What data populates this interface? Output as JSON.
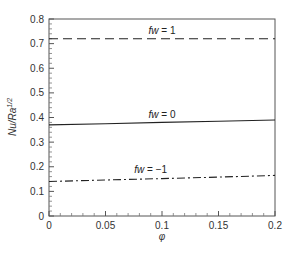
{
  "chart_data": {
    "type": "line",
    "title": "",
    "xlabel": "φ",
    "ylabel": "Nu/Ra^1/2",
    "ylabel_main": "Nu/Ra",
    "ylabel_sup": "1/2",
    "xlim": [
      0,
      0.2
    ],
    "ylim": [
      0,
      0.8
    ],
    "grid": false,
    "legend_position": "inline labels",
    "x_ticks": [
      0,
      0.05,
      0.1,
      0.15,
      0.2
    ],
    "x_tick_labels": [
      "0",
      "0.05",
      "0.1",
      "0.15",
      "0.2"
    ],
    "y_ticks": [
      0,
      0.1,
      0.2,
      0.3,
      0.4,
      0.5,
      0.6,
      0.7,
      0.8
    ],
    "y_tick_labels": [
      "0",
      "0.1",
      "0.2",
      "0.3",
      "0.4",
      "0.5",
      "0.6",
      "0.7",
      "0.8"
    ],
    "x": [
      0,
      0.05,
      0.1,
      0.15,
      0.2
    ],
    "series": [
      {
        "name": "fw = 1",
        "label_prefix": "fw",
        "label_value": "= 1",
        "style": "dashed",
        "values": [
          0.72,
          0.72,
          0.72,
          0.72,
          0.72
        ],
        "label_at": [
          0.1,
          0.73
        ]
      },
      {
        "name": "fw = 0",
        "label_prefix": "fw",
        "label_value": "= 0",
        "style": "solid",
        "values": [
          0.37,
          0.375,
          0.38,
          0.385,
          0.39
        ],
        "label_at": [
          0.1,
          0.39
        ]
      },
      {
        "name": "fw = -1",
        "label_prefix": "fw",
        "label_value": "= −1",
        "style": "dashdot",
        "values": [
          0.14,
          0.146,
          0.152,
          0.158,
          0.165
        ],
        "label_at": [
          0.09,
          0.165
        ]
      }
    ]
  }
}
